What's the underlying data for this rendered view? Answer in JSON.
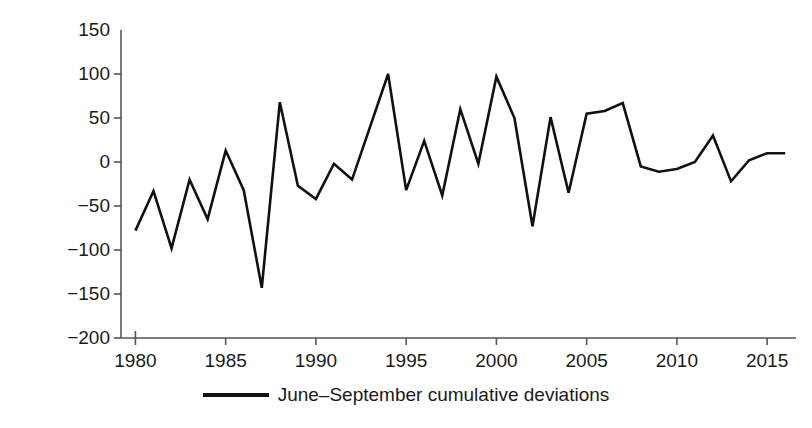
{
  "chart_data": {
    "type": "line",
    "title": "",
    "xlabel": "",
    "ylabel": "Rainfall (mm)",
    "xlim": [
      1979.2,
      2016.6
    ],
    "ylim": [
      -200,
      150
    ],
    "grid": false,
    "legend_position": "bottom-center",
    "x_ticks": [
      "1980",
      "1985",
      "1990",
      "1995",
      "2000",
      "2005",
      "2010",
      "2015"
    ],
    "x_tick_values": [
      1980,
      1985,
      1990,
      1995,
      2000,
      2005,
      2010,
      2015
    ],
    "y_ticks": [
      "150",
      "100",
      "50",
      "0",
      "−50",
      "−100",
      "−150",
      "−200"
    ],
    "y_tick_values": [
      150,
      100,
      50,
      0,
      -50,
      -100,
      -150,
      -200
    ],
    "series": [
      {
        "name": "June–September cumulative deviations",
        "color": "#111111",
        "x": [
          1980,
          1981,
          1982,
          1983,
          1984,
          1985,
          1986,
          1987,
          1988,
          1989,
          1990,
          1991,
          1992,
          1993,
          1994,
          1995,
          1996,
          1997,
          1998,
          1999,
          2000,
          2001,
          2002,
          2003,
          2004,
          2005,
          2006,
          2007,
          2008,
          2009,
          2010,
          2011,
          2012,
          2013,
          2014,
          2015,
          2016
        ],
        "values": [
          -78,
          -33,
          -98,
          -20,
          -65,
          13,
          -32,
          -143,
          68,
          -27,
          -42,
          -2,
          -20,
          40,
          100,
          -32,
          24,
          -38,
          60,
          -2,
          97,
          50,
          -73,
          51,
          -35,
          55,
          58,
          67,
          -5,
          -11,
          -8,
          0,
          30,
          -22,
          2,
          10,
          10
        ]
      }
    ]
  },
  "legend": {
    "entries": [
      {
        "label": "June–September cumulative deviations",
        "color": "#111111"
      }
    ]
  },
  "axes": {
    "y_axis_label": "Rainfall (mm)"
  }
}
